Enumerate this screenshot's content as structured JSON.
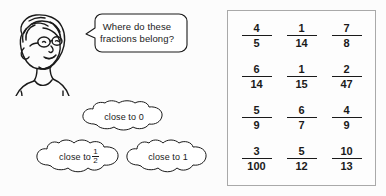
{
  "worksheet": {
    "character": {
      "icon": "child-head-with-glasses-illustration",
      "alt": "line drawing of a child wearing glasses"
    },
    "speech_bubble": {
      "line1": "Where do these",
      "line2": "fractions belong?"
    },
    "clouds": [
      {
        "id": "close-to-0",
        "label": "close to 0",
        "has_fraction": false
      },
      {
        "id": "close-to-half",
        "label": "close to",
        "has_fraction": true,
        "numerator": "1",
        "denominator": "2"
      },
      {
        "id": "close-to-1",
        "label": "close to 1",
        "has_fraction": false
      }
    ],
    "fraction_box": {
      "rows": [
        [
          {
            "numerator": "4",
            "denominator": "5"
          },
          {
            "numerator": "1",
            "denominator": "14"
          },
          {
            "numerator": "7",
            "denominator": "8"
          }
        ],
        [
          {
            "numerator": "6",
            "denominator": "14"
          },
          {
            "numerator": "1",
            "denominator": "15"
          },
          {
            "numerator": "2",
            "denominator": "47"
          }
        ],
        [
          {
            "numerator": "5",
            "denominator": "9"
          },
          {
            "numerator": "6",
            "denominator": "7"
          },
          {
            "numerator": "4",
            "denominator": "9"
          }
        ],
        [
          {
            "numerator": "3",
            "denominator": "100"
          },
          {
            "numerator": "5",
            "denominator": "12"
          },
          {
            "numerator": "10",
            "denominator": "13"
          }
        ]
      ]
    },
    "colors": {
      "ink": "#1a1a1a",
      "box_border": "#a9a9a9",
      "background": "#fcfcfc"
    }
  }
}
